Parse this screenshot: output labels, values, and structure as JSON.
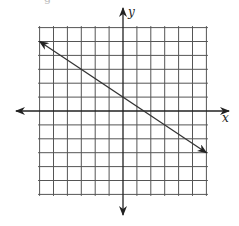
{
  "chart_data": {
    "type": "line",
    "title": "",
    "xlabel": "x",
    "ylabel": "y",
    "xlim": [
      -6,
      6
    ],
    "ylim": [
      -6,
      6
    ],
    "grid": true,
    "grid_step": 1,
    "tick_labels": false,
    "series": [
      {
        "name": "line",
        "equation": "y = -2/3 x + 1",
        "slope": -0.6667,
        "intercept": 1,
        "points": [
          [
            -6,
            5
          ],
          [
            0,
            1
          ],
          [
            1.5,
            0
          ],
          [
            6,
            -3
          ]
        ],
        "arrows_both_ends": true
      }
    ],
    "colors": {
      "grid": "#555555",
      "axis": "#222222",
      "line": "#333333"
    }
  },
  "labels": {
    "x_axis": "x",
    "y_axis": "y",
    "top_fragment": "g"
  }
}
